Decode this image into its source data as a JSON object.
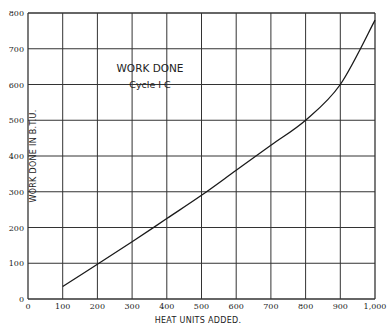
{
  "chart_data": {
    "type": "line",
    "title": "WORK DONE",
    "subtitle": "Cycle I C",
    "xlabel": "HEAT UNITS ADDED.",
    "ylabel": "WORK DONE IN B.T.U.",
    "xlim": [
      0,
      1000
    ],
    "ylim": [
      0,
      800
    ],
    "grid": true,
    "legend": null,
    "x_ticks": [
      0,
      100,
      200,
      300,
      400,
      500,
      600,
      700,
      800,
      900,
      1000
    ],
    "x_tick_labels": [
      "0",
      "100",
      "200",
      "300",
      "400",
      "500",
      "600",
      "700",
      "800",
      "900",
      "1,000"
    ],
    "y_ticks": [
      0,
      100,
      200,
      300,
      400,
      500,
      600,
      700,
      800
    ],
    "y_tick_labels": [
      "0",
      "100",
      "200",
      "300",
      "400",
      "500",
      "600",
      "700",
      "800"
    ],
    "series": [
      {
        "name": "Work Done, Cycle I C",
        "x": [
          100,
          200,
          300,
          400,
          500,
          600,
          700,
          800,
          900,
          1000
        ],
        "y": [
          35,
          97,
          160,
          225,
          290,
          360,
          430,
          500,
          600,
          780
        ]
      }
    ],
    "colors": {
      "line": "#1a1a1a",
      "grid": "#333333",
      "background": "#ffffff"
    }
  }
}
